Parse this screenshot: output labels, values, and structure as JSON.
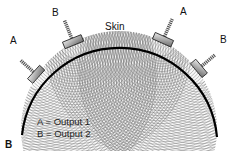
{
  "diagram": {
    "skin_label": "Skin",
    "transducers": [
      {
        "label": "A",
        "side": "left"
      },
      {
        "label": "B",
        "side": "left"
      },
      {
        "label": "A",
        "side": "right"
      },
      {
        "label": "B",
        "side": "right"
      }
    ],
    "legend": {
      "line1": "A = Output 1",
      "line2": "B = Output 2"
    },
    "panel_letter": "B",
    "colors": {
      "skin_line": "#000000",
      "wave_lines": "#6b6b6b",
      "transducer_fill": "#b5b5b5"
    }
  }
}
